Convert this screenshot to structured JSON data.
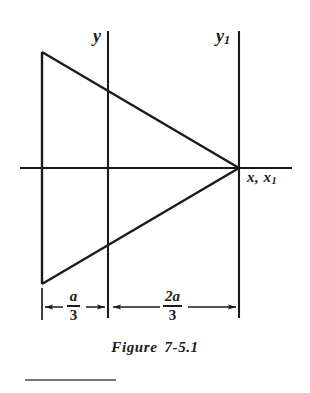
{
  "figure": {
    "caption_prefix": "Figure",
    "caption_number": "7-5.1"
  },
  "axes": [
    {
      "name": "y-axis",
      "label": "y",
      "subscript": ""
    },
    {
      "name": "y1-axis",
      "label": "y",
      "subscript": "1"
    },
    {
      "name": "x-axis",
      "label": "x, x",
      "subscript": "1"
    }
  ],
  "axis_labels": {
    "y": "y",
    "y1_base": "y",
    "y1_sub": "1",
    "x_base": "x, x",
    "x_sub": "1"
  },
  "dimensions": [
    {
      "name": "dimension-a-over-3",
      "numerator": "a",
      "denominator": "3",
      "from": "triangle-left-edge",
      "to": "y-axis"
    },
    {
      "name": "dimension-2a-over-3",
      "numerator": "2a",
      "denominator": "3",
      "from": "y-axis",
      "to": "y1-axis"
    }
  ],
  "diagram": {
    "type": "triangle-centroid-diagram",
    "triangle": {
      "vertices": [
        {
          "name": "top-left",
          "x": 42,
          "y": 52
        },
        {
          "name": "bottom-left",
          "x": 42,
          "y": 284
        },
        {
          "name": "apex-right",
          "x": 239,
          "y": 168
        }
      ]
    },
    "lines": {
      "x_axis": {
        "x1": 20,
        "y1": 168,
        "x2": 292,
        "y2": 168
      },
      "y_axis": {
        "x1": 108,
        "y1": 31,
        "x2": 108,
        "y2": 318
      },
      "y1_axis": {
        "x1": 239,
        "y1": 31,
        "x2": 239,
        "y2": 318
      }
    },
    "stroke_color": "#1a1a1a",
    "background_color": "#ffffff"
  },
  "colors": {
    "ink": "#1a1a1a",
    "background": "#ffffff"
  }
}
